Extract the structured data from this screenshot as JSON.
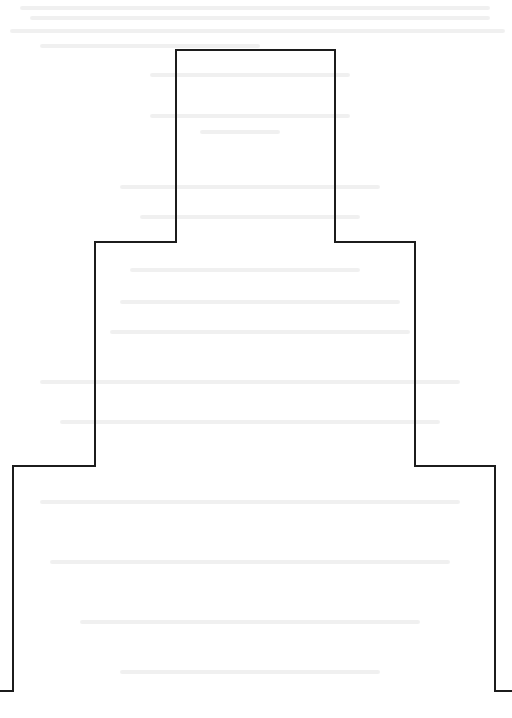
{
  "page": {
    "background": "#ffffff",
    "stroke_color": "#1c1c1c",
    "stroke_width": 2
  },
  "figure": {
    "shape": "stepped-outline",
    "points": [
      [
        0,
        691
      ],
      [
        13,
        691
      ],
      [
        13,
        466
      ],
      [
        95,
        466
      ],
      [
        95,
        242
      ],
      [
        176,
        242
      ],
      [
        176,
        50
      ],
      [
        335,
        50
      ],
      [
        335,
        242
      ],
      [
        415,
        242
      ],
      [
        415,
        466
      ],
      [
        495,
        466
      ],
      [
        495,
        691
      ],
      [
        512,
        691
      ]
    ]
  },
  "bleed_through": {
    "note": "Faint illegible text from reverse side of scanned page"
  }
}
